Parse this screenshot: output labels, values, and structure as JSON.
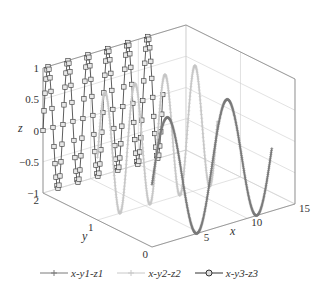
{
  "chart_data": {
    "type": "line3d",
    "title": "",
    "xlabel": "x",
    "ylabel": "y",
    "zlabel": "z",
    "xlim": [
      0,
      15
    ],
    "ylim": [
      0,
      2
    ],
    "zlim": [
      -1,
      1
    ],
    "xticks": [
      "5",
      "10",
      "15"
    ],
    "xtick_values": [
      5,
      10,
      15
    ],
    "yticks": [
      "0",
      "1",
      "2"
    ],
    "ytick_values": [
      0,
      1,
      2
    ],
    "zticks": [
      "-1",
      "-0.5",
      "0",
      "0.5",
      "1"
    ],
    "ztick_values": [
      -1,
      -0.5,
      0,
      0.5,
      1
    ],
    "grid": true,
    "legend_position": "bottom",
    "x_range": [
      0,
      12.566
    ],
    "series": [
      {
        "name": "x-y1-z1",
        "y": 0,
        "z_function": "sin(x)",
        "color": "#7a7a7a",
        "marker": "+"
      },
      {
        "name": "x-y2-z2",
        "y": 1,
        "z_function": "sin(2x)",
        "color": "#c8c8c8",
        "marker": "+"
      },
      {
        "name": "x-y3-z3",
        "y": 2,
        "z_function": "sin(3x)",
        "color": "#333333",
        "marker": "o"
      }
    ]
  },
  "legend": {
    "items": [
      {
        "label": "x-y1-z1"
      },
      {
        "label": "x-y2-z2"
      },
      {
        "label": "x-y3-z3"
      }
    ]
  }
}
